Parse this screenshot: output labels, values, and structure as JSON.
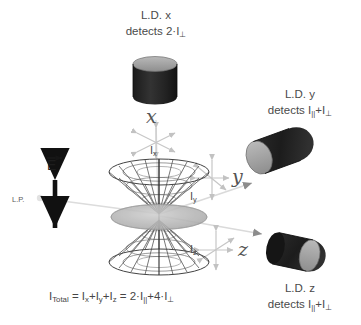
{
  "diagram": {
    "title_implicit": "Linear dichroism detection geometry",
    "background_color": "#ffffff",
    "ink_color": "#4a4a4a",
    "detector_body_color": "#262626",
    "detector_face_color": "#9a9a9a",
    "ray_color": "#d2d2d2",
    "axis_marker_color": "#c4c4c4",
    "cone_line_color": "#3a3a3a",
    "disc_color": "#b4b4b4"
  },
  "detectors": [
    {
      "id": "x",
      "name": "L.D. x",
      "detects_prefix": "detects 2·I",
      "detects_sub": "⊥",
      "line1": "L.D. x",
      "orientation": "upright"
    },
    {
      "id": "y",
      "name": "L.D. y",
      "detects_prefix": "detects I",
      "detects_sub1": "||",
      "detects_mid": "+I",
      "detects_sub2": "⊥",
      "line1": "L.D. y",
      "orientation": "tilted-left-face"
    },
    {
      "id": "z",
      "name": "L.D. z",
      "detects_prefix": "detects I",
      "detects_sub1": "||",
      "detects_mid": "+I",
      "detects_sub2": "⊥",
      "line1": "L.D. z",
      "orientation": "tilted-right-face"
    }
  ],
  "axes": [
    {
      "id": "x",
      "letter": "x",
      "intensity_label": "I",
      "intensity_sub": "x"
    },
    {
      "id": "y",
      "letter": "y",
      "intensity_label": "I",
      "intensity_sub": "y"
    },
    {
      "id": "z",
      "letter": "z",
      "intensity_label": "I",
      "intensity_sub": "z"
    }
  ],
  "source": {
    "lp_label": "L.P.",
    "e_field_label": "E",
    "e_field_vector_arrow": "→",
    "polarization_arrow": "double-headed-vertical"
  },
  "formula": {
    "lead": "I",
    "lead_sub": "Total",
    "body": " = I",
    "parts": "I_x+I_y+I_z = 2·I_||+4·I_⊥",
    "segment1_sub": "x",
    "segment2": "+I",
    "segment2_sub": "y",
    "segment3": "+I",
    "segment3_sub": "z",
    "equals": " = 2·I",
    "par_sub": "||",
    "plus4": "+4·I",
    "perp_sub": "⊥"
  }
}
